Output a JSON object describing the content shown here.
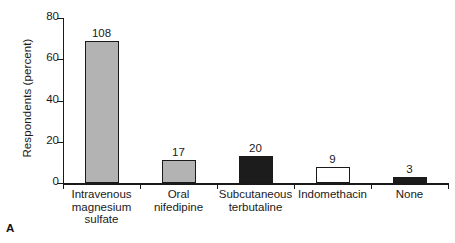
{
  "chart_data": {
    "type": "bar",
    "title": "",
    "panel_label": "A",
    "xlabel": "",
    "ylabel": "Respondents (percent)",
    "ylim": [
      0,
      80
    ],
    "yticks": [
      0,
      20,
      40,
      60,
      80
    ],
    "ytick_labels": [
      "0",
      "20",
      "40",
      "60",
      "80"
    ],
    "grid": false,
    "legend": false,
    "categories": [
      "Intravenous magnesium sulfate",
      "Oral nifedipine",
      "Subcutaneous terbutaline",
      "Indomethacin",
      "None"
    ],
    "category_lines": [
      [
        "Intravenous",
        "magnesium",
        "sulfate"
      ],
      [
        "Oral",
        "nifedipine"
      ],
      [
        "Subcutaneous",
        "terbutaline"
      ],
      [
        "Indomethacin"
      ],
      [
        "None"
      ]
    ],
    "values": [
      69,
      11,
      13,
      8,
      3
    ],
    "data_labels": [
      "108",
      "17",
      "20",
      "9",
      "3"
    ],
    "bar_fills": [
      "#b3b3b3",
      "#b3b3b3",
      "#1c1c1c",
      "#ffffff",
      "#1c1c1c"
    ],
    "bar_edge_color": "#1a1a1a",
    "axis_color": "#1a1a1a",
    "background": "#ffffff"
  }
}
